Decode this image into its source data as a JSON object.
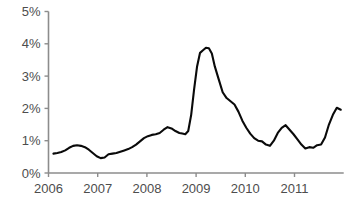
{
  "chart_data": {
    "type": "line",
    "title": "",
    "subtitle": "",
    "xlabel": "",
    "ylabel": "",
    "xlim": [
      2006.0,
      2012.0
    ],
    "ylim": [
      0,
      5
    ],
    "grid": false,
    "legend": null,
    "y_tick_labels": [
      "5%",
      "4%",
      "3%",
      "2%",
      "1%",
      "0%"
    ],
    "y_tick_values": [
      5,
      4,
      3,
      2,
      1,
      0
    ],
    "x_tick_labels": [
      "2006",
      "2007",
      "2008",
      "2009",
      "2010",
      "2011"
    ],
    "x_tick_values": [
      2006,
      2007,
      2008,
      2009,
      2010,
      2011
    ],
    "series": [
      {
        "name": "rate",
        "color": "#0a0a0a",
        "x": [
          2006.1,
          2006.18,
          2006.26,
          2006.34,
          2006.42,
          2006.5,
          2006.58,
          2006.66,
          2006.74,
          2006.82,
          2006.9,
          2006.98,
          2007.06,
          2007.14,
          2007.22,
          2007.3,
          2007.38,
          2007.46,
          2007.54,
          2007.62,
          2007.7,
          2007.78,
          2007.86,
          2007.94,
          2008.02,
          2008.1,
          2008.18,
          2008.26,
          2008.34,
          2008.42,
          2008.5,
          2008.58,
          2008.66,
          2008.72,
          2008.78,
          2008.84,
          2008.9,
          2008.96,
          2009.02,
          2009.08,
          2009.14,
          2009.2,
          2009.26,
          2009.32,
          2009.38,
          2009.46,
          2009.54,
          2009.62,
          2009.7,
          2009.78,
          2009.86,
          2009.94,
          2010.02,
          2010.1,
          2010.18,
          2010.26,
          2010.34,
          2010.42,
          2010.5,
          2010.58,
          2010.66,
          2010.74,
          2010.82,
          2010.9,
          2010.98,
          2011.06,
          2011.14,
          2011.22,
          2011.3,
          2011.38,
          2011.46,
          2011.54,
          2011.62,
          2011.7,
          2011.78,
          2011.86,
          2011.94
        ],
        "y": [
          0.6,
          0.62,
          0.65,
          0.7,
          0.78,
          0.84,
          0.86,
          0.84,
          0.8,
          0.72,
          0.62,
          0.52,
          0.46,
          0.48,
          0.58,
          0.6,
          0.62,
          0.66,
          0.7,
          0.74,
          0.8,
          0.88,
          0.98,
          1.08,
          1.14,
          1.18,
          1.2,
          1.24,
          1.34,
          1.42,
          1.38,
          1.3,
          1.24,
          1.22,
          1.2,
          1.3,
          1.8,
          2.6,
          3.3,
          3.72,
          3.8,
          3.88,
          3.86,
          3.7,
          3.3,
          2.9,
          2.5,
          2.32,
          2.22,
          2.12,
          1.9,
          1.62,
          1.4,
          1.22,
          1.08,
          1.0,
          0.98,
          0.88,
          0.84,
          1.0,
          1.24,
          1.4,
          1.48,
          1.34,
          1.2,
          1.04,
          0.88,
          0.76,
          0.8,
          0.78,
          0.86,
          0.88,
          1.1,
          1.5,
          1.8,
          2.02,
          1.96
        ]
      }
    ]
  }
}
